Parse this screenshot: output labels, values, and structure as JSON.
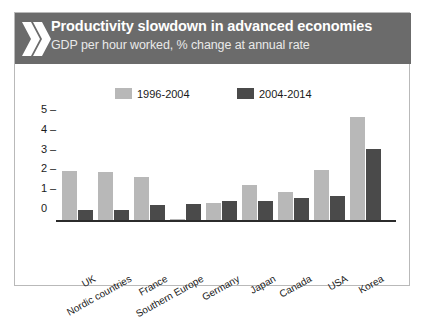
{
  "header": {
    "title": "Productivity slowdown in advanced economies",
    "subtitle": "GDP per hour worked, % change at annual rate",
    "icon": "double-chevron-icon",
    "background_color": "#6b6b6b",
    "title_color": "#ffffff"
  },
  "chart_data": {
    "type": "bar",
    "title": "Productivity slowdown in advanced economies",
    "subtitle": "GDP per hour worked, % change at annual rate",
    "xlabel": "",
    "ylabel": "",
    "ylim": [
      0,
      5.4
    ],
    "yticks": [
      0,
      1,
      2,
      3,
      4,
      5
    ],
    "ytick_labels": [
      "0",
      "1",
      "2",
      "3",
      "4",
      "5"
    ],
    "grid": false,
    "legend_position": "top",
    "categories": [
      "UK",
      "Nordic countries",
      "France",
      "Southern Europe",
      "Germany",
      "Japan",
      "Canada",
      "USA",
      "Korea"
    ],
    "series": [
      {
        "name": "1996-2004",
        "color": "#b8b8b8",
        "values": [
          2.45,
          2.4,
          2.15,
          0.05,
          0.85,
          1.75,
          1.4,
          2.5,
          5.2
        ]
      },
      {
        "name": "2004-2014",
        "color": "#4a4a4a",
        "values": [
          0.5,
          0.5,
          0.75,
          0.8,
          0.95,
          0.95,
          1.1,
          1.2,
          3.6
        ]
      }
    ]
  }
}
